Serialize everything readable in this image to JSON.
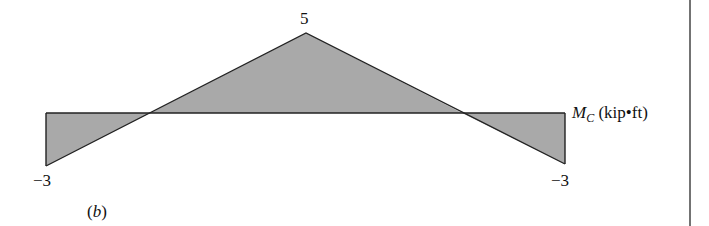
{
  "diagram": {
    "type": "moment_influence_line",
    "quantity_symbol": "M",
    "quantity_subscript": "C",
    "units": "(kip•ft)",
    "subfigure_label": "(b)",
    "fill_color": "#a9a9a9",
    "stroke_color": "#222222",
    "points": [
      {
        "position": "left_end",
        "value": -3,
        "label": "−3"
      },
      {
        "position": "zero_crossing_left",
        "value": 0
      },
      {
        "position": "peak",
        "value": 5,
        "label": "5"
      },
      {
        "position": "zero_crossing_right",
        "value": 0
      },
      {
        "position": "right_end",
        "value": -3,
        "label": "−3"
      }
    ],
    "labels": {
      "left_value": "−3",
      "peak_value": "5",
      "right_value": "−3"
    }
  }
}
